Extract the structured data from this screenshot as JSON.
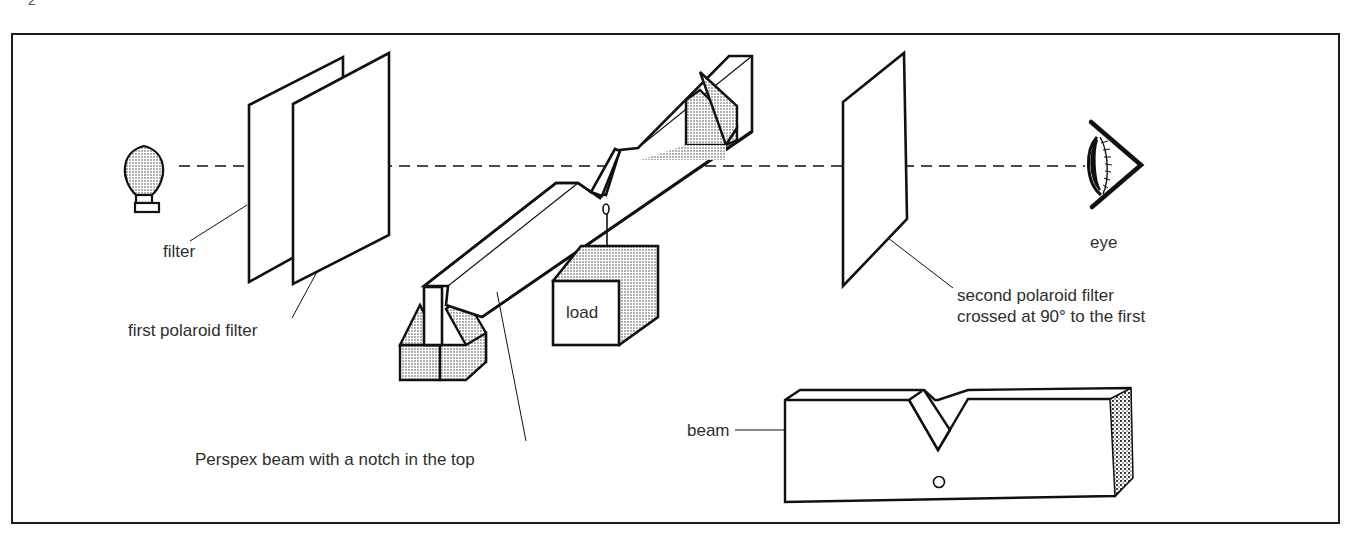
{
  "page": {
    "number_partial": "2"
  },
  "figure": {
    "labels": {
      "filter": "filter",
      "first_polaroid": "first polaroid filter",
      "load": "load",
      "perspex_beam": "Perspex beam with a notch in the top",
      "second_polaroid_line1": "second polaroid filter",
      "second_polaroid_line2": "crossed at 90° to the first",
      "eye": "eye",
      "beam": "beam"
    },
    "components": [
      "light-bulb",
      "filter",
      "first-polaroid-filter",
      "perspex-beam-with-notch",
      "supports",
      "load",
      "second-polaroid-filter",
      "eye",
      "beam-detail"
    ],
    "colors": {
      "line": "#111111",
      "shading": "#bdbdbd",
      "text": "#2e2e2e"
    }
  }
}
